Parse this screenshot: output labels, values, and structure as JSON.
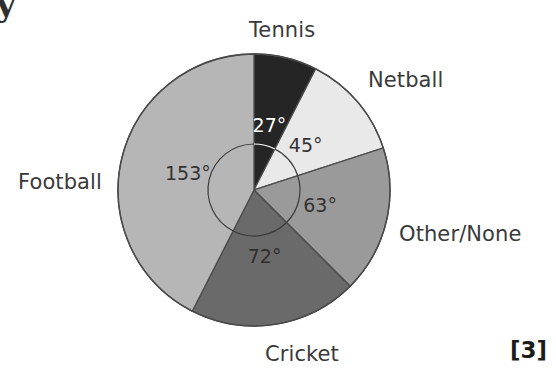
{
  "page": {
    "marks_label": "[3]",
    "clipped_glyph": "y"
  },
  "chart_data": {
    "type": "pie",
    "title": "",
    "unit": "degrees",
    "total_degrees": 360,
    "center": {
      "x": 254,
      "y": 190
    },
    "radius": 136,
    "start_angle_deg": 0,
    "direction": "clockwise",
    "categories": [
      "Tennis",
      "Netball",
      "Other/None",
      "Cricket",
      "Football"
    ],
    "values": [
      27,
      45,
      63,
      72,
      153
    ],
    "value_labels": [
      "27°",
      "45°",
      "63°",
      "72°",
      "153°"
    ],
    "colors": [
      "#252525",
      "#e9e9e9",
      "#9a9a9a",
      "#6a6a6a",
      "#b6b6b6"
    ],
    "label_text_colors": [
      "#ffffff",
      "#333333",
      "#333333",
      "#2e2e2e",
      "#333333"
    ],
    "legend": "none",
    "slices": [
      {
        "name": "Tennis",
        "value_deg": 27,
        "value_label": "27°",
        "color": "#252525",
        "label_color": "#ffffff",
        "start_deg": 0,
        "end_deg": 27,
        "outer_label": "Tennis",
        "outer_label_position": "top"
      },
      {
        "name": "Netball",
        "value_deg": 45,
        "value_label": "45°",
        "color": "#e9e9e9",
        "label_color": "#333333",
        "start_deg": 27,
        "end_deg": 72,
        "outer_label": "Netball",
        "outer_label_position": "top-right"
      },
      {
        "name": "Other/None",
        "value_deg": 63,
        "value_label": "63°",
        "color": "#9a9a9a",
        "label_color": "#333333",
        "start_deg": 72,
        "end_deg": 135,
        "outer_label": "Other/None",
        "outer_label_position": "right"
      },
      {
        "name": "Cricket",
        "value_deg": 72,
        "value_label": "72°",
        "color": "#6a6a6a",
        "label_color": "#2e2e2e",
        "start_deg": 135,
        "end_deg": 207,
        "outer_label": "Cricket",
        "outer_label_position": "bottom"
      },
      {
        "name": "Football",
        "value_deg": 153,
        "value_label": "153°",
        "color": "#b6b6b6",
        "label_color": "#333333",
        "start_deg": 207,
        "end_deg": 360,
        "outer_label": "Football",
        "outer_label_position": "left"
      }
    ]
  }
}
